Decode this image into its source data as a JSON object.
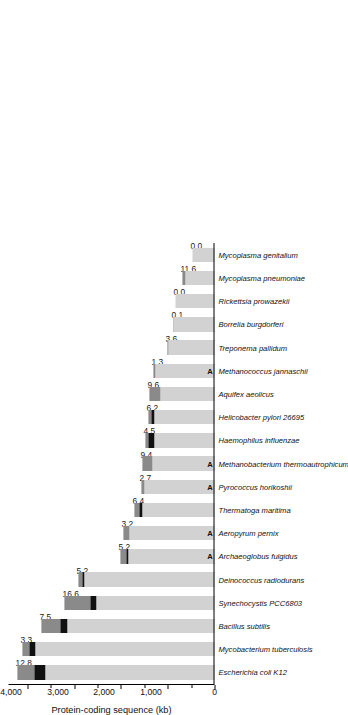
{
  "chart_data": {
    "type": "bar",
    "title": "",
    "xlabel": "",
    "ylabel": "Protein-coding sequence (kb)",
    "orientation": "vertical-rotated",
    "ylim": [
      0,
      4400
    ],
    "yticks": [
      0,
      1000,
      2000,
      3000,
      4000
    ],
    "ytick_labels": [
      "0",
      "1,000",
      "2,000",
      "3,000",
      "4,000"
    ],
    "grid": false,
    "legend": "none",
    "categories": [
      "Escherichia coli K12",
      "Mycobacterium tuberculosis",
      "Bacillus subtilis",
      "Synechocystis PCC6803",
      "Deinococcus radiodurans",
      "Archaeoglobus fulgidus",
      "Aeropyrum pernix",
      "Thermatoga maritima",
      "Pyrococcus horikoshii",
      "Methanobacterium thermoautrophicum",
      "Haemophilus influenzae",
      "Helicobacter pylori 26695",
      "Aquifex aeolicus",
      "Methanococcus jannaschii",
      "Treponema pallidum",
      "Borrelia burgdorferi",
      "Rickettsia prowazekii",
      "Mycoplasma pneumoniae",
      "Mycoplasma genitalium"
    ],
    "domain_marks": [
      "",
      "",
      "",
      "",
      "",
      "A",
      "A",
      "",
      "A",
      "A",
      "",
      "",
      "",
      "A",
      "",
      "",
      "",
      "",
      ""
    ],
    "values": [
      4200,
      4100,
      3700,
      3200,
      2900,
      2000,
      1950,
      1700,
      1560,
      1530,
      1480,
      1420,
      1380,
      1300,
      1010,
      870,
      840,
      690,
      480
    ],
    "data_labels": [
      "12.8",
      "3.3",
      "7.5",
      "16.6",
      "5.2",
      "5.2",
      "3.2",
      "6.4",
      "2.7",
      "9.4",
      "4.5",
      "6.2",
      "9.6",
      "1.3",
      "3.6",
      "0.1",
      "0.0",
      "11.6",
      "0.0"
    ],
    "series": [
      {
        "name": "light-grey-core",
        "color": "#d2d2d2",
        "values": [
          3620,
          3820,
          3140,
          2520,
          2770,
          1830,
          1810,
          1540,
          1500,
          1330,
          1290,
          1290,
          1160,
          1270,
          975,
          866,
          840,
          620,
          480
        ]
      },
      {
        "name": "black-band",
        "color": "#111111",
        "values": [
          230,
          130,
          160,
          120,
          50,
          40,
          0,
          60,
          0,
          0,
          120,
          50,
          0,
          0,
          0,
          0,
          0,
          0,
          0
        ]
      },
      {
        "name": "dark-grey-tip",
        "color": "#8a8a8a",
        "values": [
          350,
          150,
          400,
          560,
          80,
          130,
          140,
          100,
          60,
          200,
          70,
          80,
          220,
          30,
          35,
          4,
          0,
          70,
          0
        ]
      }
    ]
  },
  "axis": {
    "title": "Protein-coding sequence (kb)"
  },
  "marks": {
    "archaea_symbol": "A"
  }
}
